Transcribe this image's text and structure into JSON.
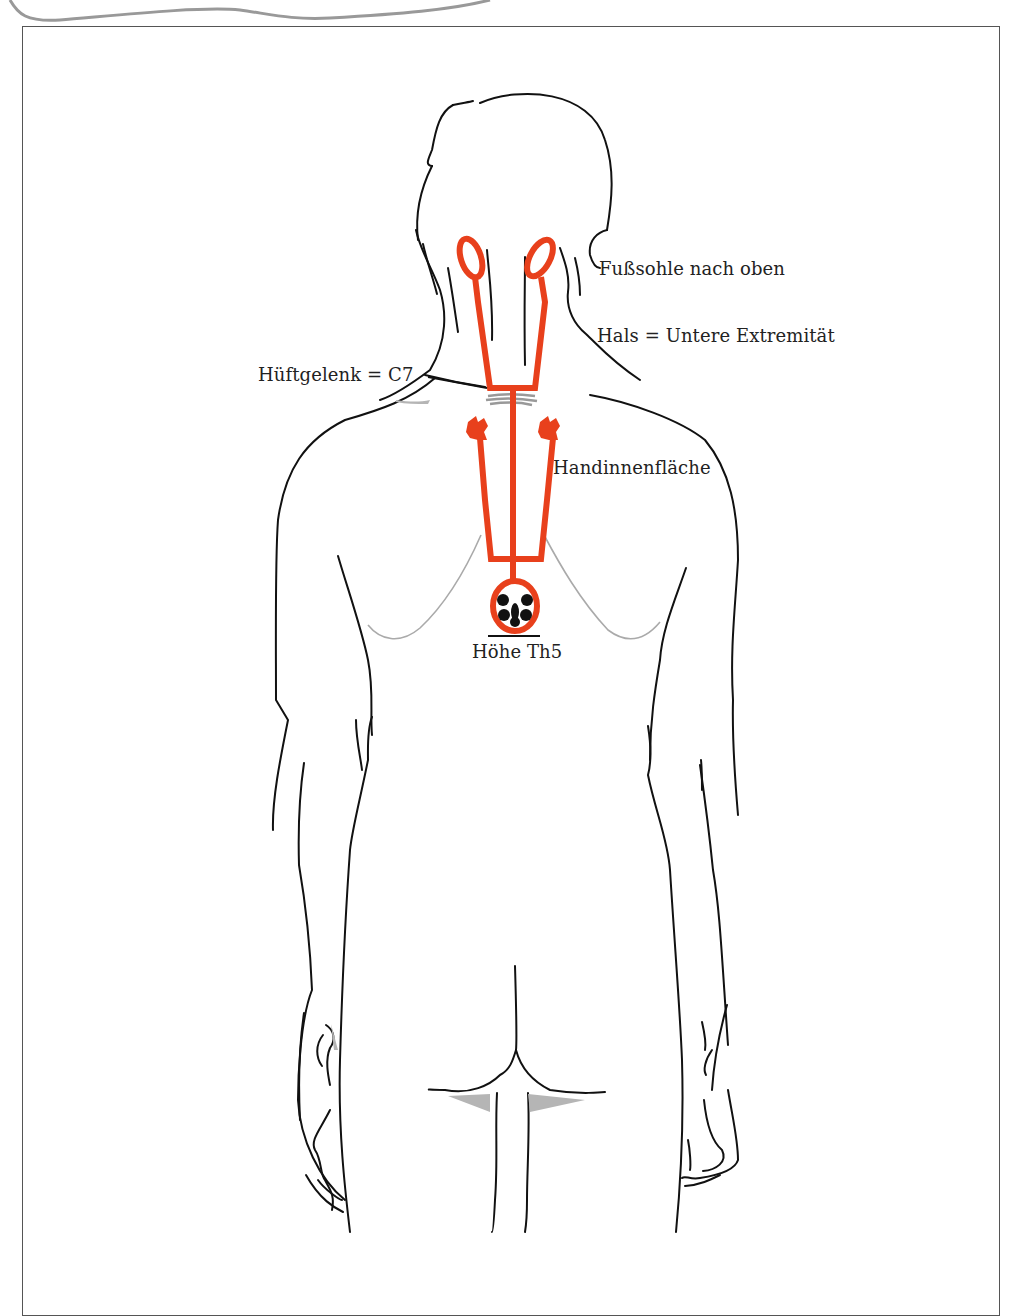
{
  "diagram": {
    "colors": {
      "outline": "#111111",
      "projection": "#e8401c",
      "rib_line": "#aaaaaa",
      "shading": "#b5b5b5",
      "frame": "#555555"
    },
    "labels": {
      "foot_sole": "Fußsohle nach oben",
      "neck": "Hals = Untere Extremität",
      "hip_joint": "Hüftgelenk = C7",
      "palm": "Handinnenfläche",
      "th5_level": "Höhe Th5"
    }
  }
}
